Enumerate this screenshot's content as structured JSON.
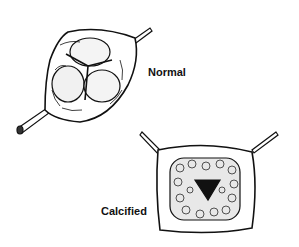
{
  "figure": {
    "labels": {
      "normal": "Normal",
      "calcified": "Calcified"
    },
    "panels": [
      {
        "name": "normal-valve",
        "description": "Tricuspid aortic valve with three smooth cusps, retracted by two instruments"
      },
      {
        "name": "calcified-valve",
        "description": "Calcified aortic valve with nodular cusps and narrowed triangular orifice, retracted by two instruments"
      }
    ],
    "colors": {
      "ink": "#111111",
      "background": "#ffffff"
    }
  }
}
